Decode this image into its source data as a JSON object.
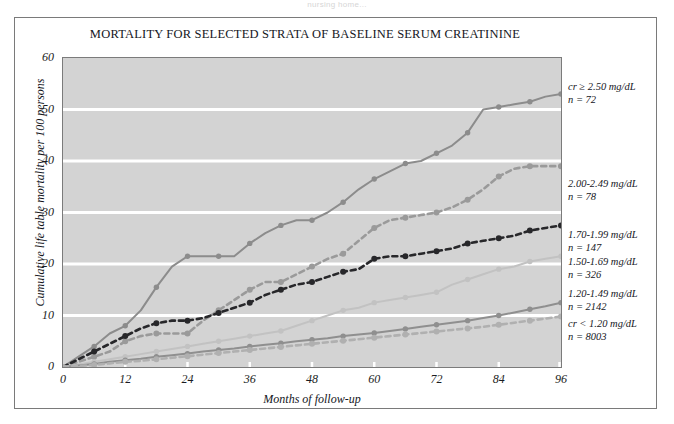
{
  "top_strip_text": "nursing home...",
  "figure": {
    "title": "MORTALITY FOR SELECTED STRATA OF BASELINE SERUM CREATININE"
  },
  "axes": {
    "ylabel": "Cumulative life table mortality per 100 persons",
    "xlabel": "Months of follow-up",
    "yticks": [
      "0",
      "10",
      "20",
      "30",
      "40",
      "50",
      "60"
    ],
    "xticks": [
      "0",
      "12",
      "24",
      "36",
      "48",
      "60",
      "72",
      "84",
      "96"
    ]
  },
  "annotations": [
    {
      "label": "cr ≥ 2.50 mg/dL",
      "n": "n = 72"
    },
    {
      "label": "2.00-2.49 mg/dL",
      "n": "n = 78"
    },
    {
      "label": "1.70-1.99 mg/dL",
      "n": "n = 147"
    },
    {
      "label": "1.50-1.69 mg/dL",
      "n": "n = 326"
    },
    {
      "label": "1.20-1.49 mg/dL",
      "n": "n = 2142"
    },
    {
      "label": "cr < 1.20 mg/dL",
      "n": "n = 8003"
    }
  ],
  "colors": {
    "plot_background": "#d3d3d3",
    "gridline": "#ffffff",
    "frame": "#7b7b7b",
    "series_cr_ge_250": "#8c8c8c",
    "series_200_249": "#9a9a9a",
    "series_170_199": "#27272a",
    "series_150_169": "#c2c2c2",
    "series_120_149": "#8f8f8f",
    "series_cr_lt_120": "#b0b0b0"
  },
  "chart_data": {
    "type": "line",
    "title": "MORTALITY FOR SELECTED STRATA OF BASELINE SERUM CREATININE",
    "xlabel": "Months of follow-up",
    "ylabel": "Cumulative life table mortality per 100 persons",
    "xlim": [
      0,
      96
    ],
    "ylim": [
      0,
      60
    ],
    "xticks": [
      0,
      12,
      24,
      36,
      48,
      60,
      72,
      84,
      96
    ],
    "yticks": [
      0,
      10,
      20,
      30,
      40,
      50,
      60
    ],
    "grid": "horizontal",
    "legend_position": "right-annotations",
    "x": [
      0,
      3,
      6,
      9,
      12,
      15,
      18,
      21,
      24,
      27,
      30,
      33,
      36,
      39,
      42,
      45,
      48,
      51,
      54,
      57,
      60,
      63,
      66,
      69,
      72,
      75,
      78,
      81,
      84,
      87,
      90,
      93,
      96
    ],
    "series": [
      {
        "name": "cr ≥ 2.50 mg/dL",
        "n": 72,
        "color": "#8c8c8c",
        "dash": "solid",
        "values": [
          0,
          2.0,
          4.0,
          6.5,
          8.0,
          11.0,
          15.5,
          19.5,
          21.5,
          21.5,
          21.5,
          21.5,
          24.0,
          26.0,
          27.5,
          28.5,
          28.5,
          30.0,
          32.0,
          34.5,
          36.5,
          38.0,
          39.5,
          40.0,
          41.5,
          43.0,
          45.5,
          50.0,
          50.5,
          51.0,
          51.5,
          52.5,
          53.0
        ]
      },
      {
        "name": "2.00-2.49 mg/dL",
        "n": 78,
        "color": "#9a9a9a",
        "dash": "dashed",
        "values": [
          0,
          1.0,
          2.0,
          3.0,
          5.0,
          6.0,
          6.5,
          6.5,
          6.5,
          9.0,
          11.0,
          13.0,
          15.0,
          16.5,
          16.5,
          18.0,
          19.5,
          21.0,
          22.0,
          24.5,
          27.0,
          28.5,
          29.0,
          29.5,
          30.0,
          31.0,
          32.5,
          34.5,
          37.0,
          38.5,
          39.0,
          39.0,
          39.0
        ]
      },
      {
        "name": "1.70-1.99 mg/dL",
        "n": 147,
        "color": "#27272a",
        "dash": "dashed",
        "values": [
          0,
          1.5,
          3.0,
          4.5,
          6.0,
          7.5,
          8.5,
          9.0,
          9.0,
          9.5,
          10.5,
          11.5,
          12.5,
          14.0,
          15.0,
          16.0,
          16.5,
          17.5,
          18.5,
          19.0,
          21.0,
          21.5,
          21.5,
          22.0,
          22.5,
          23.0,
          24.0,
          24.5,
          25.0,
          25.5,
          26.5,
          27.0,
          27.5
        ]
      },
      {
        "name": "1.50-1.69 mg/dL",
        "n": 326,
        "color": "#c2c2c2",
        "dash": "solid",
        "values": [
          0,
          0.5,
          1.0,
          1.5,
          2.0,
          2.5,
          3.0,
          3.5,
          4.0,
          4.5,
          5.0,
          5.5,
          6.0,
          6.5,
          7.0,
          8.0,
          9.0,
          10.0,
          11.0,
          11.5,
          12.5,
          13.0,
          13.5,
          14.0,
          14.5,
          16.0,
          17.0,
          18.0,
          19.0,
          19.5,
          20.5,
          21.0,
          21.5
        ]
      },
      {
        "name": "1.20-1.49 mg/dL",
        "n": 2142,
        "color": "#8f8f8f",
        "dash": "solid",
        "values": [
          0,
          0.3,
          0.6,
          1.0,
          1.3,
          1.6,
          2.0,
          2.3,
          2.6,
          3.0,
          3.3,
          3.6,
          4.0,
          4.3,
          4.6,
          5.0,
          5.3,
          5.6,
          6.0,
          6.3,
          6.6,
          7.0,
          7.4,
          7.8,
          8.2,
          8.6,
          9.0,
          9.5,
          10.0,
          10.6,
          11.2,
          11.8,
          12.5
        ]
      },
      {
        "name": "cr < 1.20 mg/dL",
        "n": 8003,
        "color": "#b0b0b0",
        "dash": "dashed",
        "values": [
          0,
          0.2,
          0.4,
          0.7,
          1.0,
          1.2,
          1.5,
          1.8,
          2.1,
          2.4,
          2.7,
          3.0,
          3.3,
          3.6,
          3.9,
          4.2,
          4.5,
          4.8,
          5.1,
          5.4,
          5.7,
          6.0,
          6.3,
          6.6,
          6.9,
          7.2,
          7.5,
          7.8,
          8.2,
          8.6,
          9.0,
          9.4,
          9.8
        ]
      }
    ]
  }
}
